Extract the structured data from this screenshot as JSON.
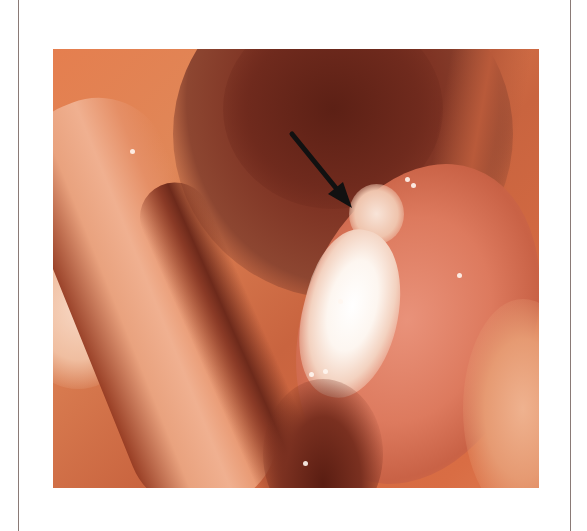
{
  "figure": {
    "type": "endoscopic photograph",
    "annotations": [
      {
        "kind": "arrow",
        "color": "#111111",
        "from": [
          292,
          134
        ],
        "to": [
          352,
          208
        ],
        "points_to": "lesion"
      }
    ],
    "colors": {
      "tissue": "#e0804f",
      "cavity": "#6e2a1c",
      "lesion": "#fdf6f0",
      "frame": "#8a7a76",
      "background": "#ffffff"
    }
  }
}
